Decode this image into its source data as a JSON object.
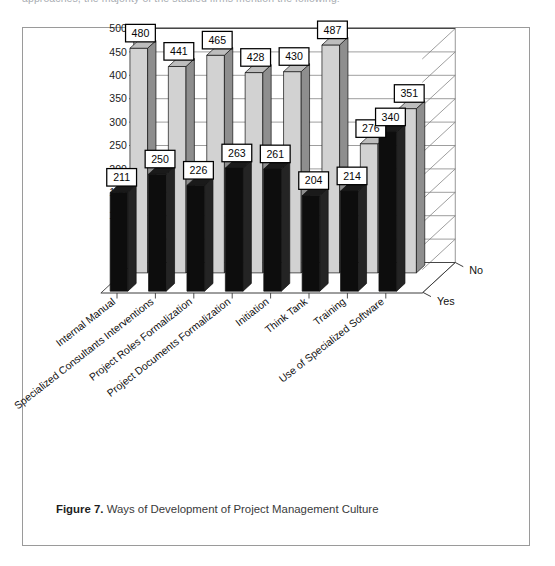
{
  "page": {
    "clipped_top_text": "approaches, the majority of the studied firms mention the following:"
  },
  "figure": {
    "caption_label": "Figure 7.",
    "caption_text": "Ways of Development of Project Management Culture"
  },
  "chart_data": {
    "type": "bar",
    "title": "Ways of Development of Project Management Culture",
    "xlabel": "",
    "ylabel": "",
    "ylim": [
      0,
      500
    ],
    "yticks": [
      0,
      50,
      100,
      150,
      200,
      250,
      300,
      350,
      400,
      450,
      500
    ],
    "ytick_labels": [
      "0",
      "50",
      "100",
      "150",
      "200",
      "250",
      "300",
      "350",
      "400",
      "450",
      "500"
    ],
    "grid": true,
    "projection": "3d",
    "legend": "depth-axis",
    "depth_categories": [
      "Yes",
      "No"
    ],
    "categories": [
      "Internal Manual",
      "Specialized Consultants Interventions",
      "Project Roles Formalization",
      "Project Documents Formalization",
      "Initiation",
      "Think Tank",
      "Training",
      "Use of Specialized Software"
    ],
    "series": [
      {
        "name": "Yes",
        "color": "#0d0d0d",
        "values": [
          211,
          250,
          226,
          263,
          261,
          204,
          214,
          340
        ]
      },
      {
        "name": "No",
        "color": "#d2d2d2",
        "values": [
          480,
          441,
          465,
          428,
          430,
          487,
          276,
          351
        ]
      }
    ]
  },
  "colors": {
    "frame": "#9a9a9a",
    "axis": "#3c3c3c",
    "grid": "#7d7d7d",
    "bar_yes_front": "#0d0d0d",
    "bar_yes_side": "#242424",
    "bar_yes_top": "#1a1a1a",
    "bar_no_front": "#d2d2d2",
    "bar_no_side": "#8e8e8e",
    "bar_no_top": "#bdbdbd",
    "label_box_bg": "#ffffff",
    "label_box_border": "#000000"
  }
}
